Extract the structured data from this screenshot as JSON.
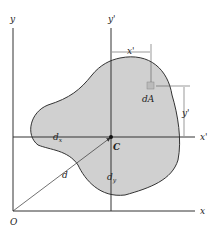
{
  "labels": {
    "y_axis": "y",
    "x_axis": "x",
    "origin": "O",
    "y_prime": "y'",
    "x_prime": "x'",
    "x_prime_dim": "x'",
    "y_prime_dim": "y'",
    "dA": "dA",
    "centroid": "C",
    "dx": "d",
    "dx_sub": "x",
    "dy": "d",
    "dy_sub": "y",
    "d": "d"
  },
  "colors": {
    "fill": "#d0d0d0",
    "stroke": "#333333"
  }
}
